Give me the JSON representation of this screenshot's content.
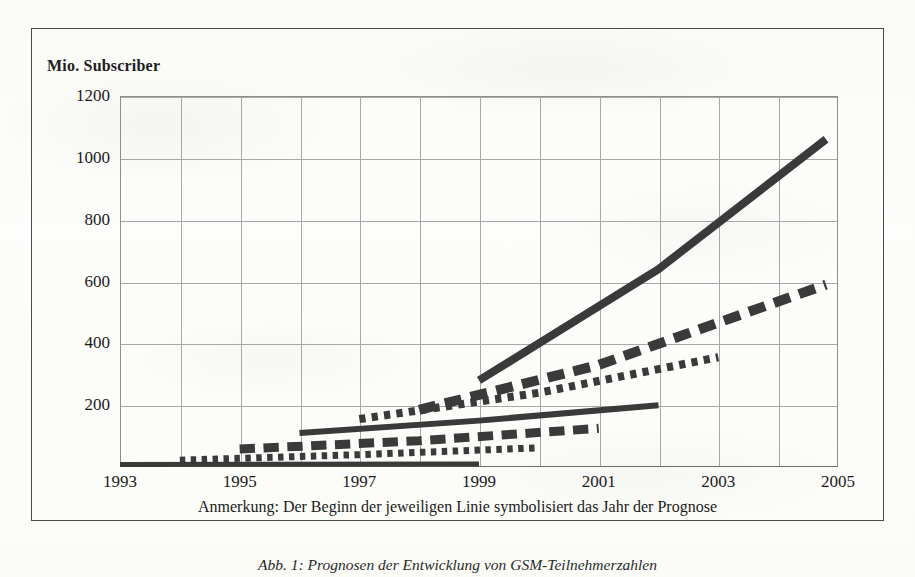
{
  "figure": {
    "y_axis_title": "Mio. Subscriber",
    "note": "Anmerkung: Der Beginn der jeweiligen Linie symbolisiert das Jahr der Prognose",
    "caption": "Abb. 1: Prognosen der Entwicklung von GSM-Teilnehmerzahlen",
    "frame_color": "#4a4a4a",
    "grid_color": "#a8a8a8",
    "ink_color": "#3a3a3a"
  },
  "chart_data": {
    "type": "line",
    "title": "Mio. Subscriber",
    "xlabel": "",
    "ylabel": "Mio. Subscriber",
    "xlim": [
      1993,
      2005
    ],
    "ylim": [
      0,
      1200
    ],
    "yticks": [
      1200,
      1000,
      800,
      600,
      400,
      200
    ],
    "xticks": [
      1993,
      1995,
      1997,
      1999,
      2001,
      2003,
      2005
    ],
    "xticks_all": [
      1993,
      1994,
      1995,
      1996,
      1997,
      1998,
      1999,
      2000,
      2001,
      2002,
      2003,
      2004,
      2005
    ],
    "grid": true,
    "legend": "none",
    "annotation": "Anmerkung: Der Beginn der jeweiligen Linie symbolisiert das Jahr der Prognose",
    "series": [
      {
        "name": "Prognose 1993",
        "forecast_year": 1993,
        "style": "solid",
        "width": 5,
        "x": [
          1993,
          1999
        ],
        "values": [
          8,
          10
        ]
      },
      {
        "name": "Prognose 1994",
        "forecast_year": 1994,
        "style": "dotted",
        "width": 7,
        "x": [
          1994,
          1997,
          2000
        ],
        "values": [
          22,
          40,
          62
        ]
      },
      {
        "name": "Prognose 1995",
        "forecast_year": 1995,
        "style": "dashed",
        "width": 9,
        "x": [
          1995,
          1998,
          2001
        ],
        "values": [
          58,
          85,
          125
        ]
      },
      {
        "name": "Prognose 1996",
        "forecast_year": 1996,
        "style": "solid",
        "width": 6,
        "x": [
          1996,
          1999,
          2002
        ],
        "values": [
          110,
          150,
          200
        ]
      },
      {
        "name": "Prognose 1997",
        "forecast_year": 1997,
        "style": "dotted",
        "width": 8,
        "x": [
          1997,
          2000,
          2003
        ],
        "values": [
          155,
          240,
          355
        ]
      },
      {
        "name": "Prognose 1998",
        "forecast_year": 1998,
        "style": "dashed",
        "width": 10,
        "x": [
          1998,
          2001,
          2004.8
        ],
        "values": [
          185,
          330,
          590
        ]
      },
      {
        "name": "Prognose 1999",
        "forecast_year": 1999,
        "style": "solid",
        "width": 8,
        "x": [
          1999,
          2002,
          2004.8
        ],
        "values": [
          280,
          640,
          1060
        ]
      }
    ]
  }
}
